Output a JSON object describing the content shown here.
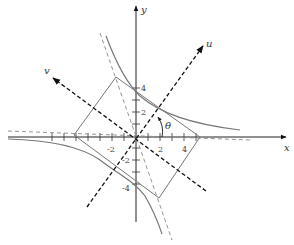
{
  "diagram": {
    "axes": {
      "x_label": "x",
      "y_label": "y",
      "u_label": "u",
      "v_label": "v",
      "angle_label": "θ"
    },
    "x_ticks": [
      "-2",
      "2",
      "4"
    ],
    "y_ticks": [
      "4",
      "2",
      "-2",
      "-4"
    ],
    "colors": {
      "axis": "#222222",
      "curve": "#777777",
      "dashed": "#888888",
      "rotated_axis": "#111111"
    }
  }
}
